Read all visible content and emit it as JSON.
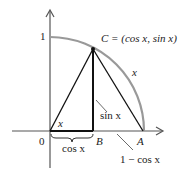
{
  "diagram": {
    "labels": {
      "one": "1",
      "zero": "0",
      "point_c": "C = (cos x, sin x)",
      "arc_x": "x",
      "angle_x": "x",
      "sin_x": "sin x",
      "cos_x": "cos x",
      "point_b": "B",
      "point_a": "A",
      "one_minus_cos": "1 − cos x"
    },
    "colors": {
      "arc": "#999999",
      "lines": "#111111"
    }
  }
}
